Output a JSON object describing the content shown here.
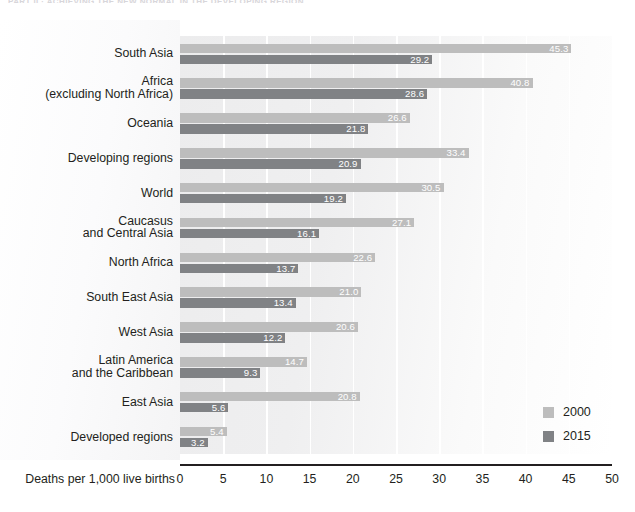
{
  "running_head": "PART II  ·  ACHIEVING THE NEW NORMAL IN THE DEVELOPING REGION",
  "axis": {
    "title": "Deaths per 1,000 live births",
    "ticks": [
      0,
      5,
      10,
      15,
      20,
      25,
      30,
      35,
      40,
      45,
      50
    ],
    "min": 0,
    "max": 50
  },
  "legend": {
    "items": [
      {
        "label": "2000",
        "color": "#bdbdbd"
      },
      {
        "label": "2015",
        "color": "#808285"
      }
    ]
  },
  "colors": {
    "series_2000": "#bdbdbd",
    "series_2015": "#808285",
    "plot_background": "#f0f0f1",
    "gridline": "#ffffff",
    "axis_line": "#231f20",
    "text": "#231f20",
    "value_label": "#ffffff"
  },
  "chart_data": {
    "type": "bar",
    "orientation": "horizontal",
    "title": "",
    "subtitle": "",
    "xlabel": "Deaths per 1,000 live births",
    "ylabel": "",
    "xlim": [
      0,
      50
    ],
    "grid": true,
    "legend_position": "bottom-right",
    "categories": [
      "South Asia",
      "Africa\n(excluding North Africa)",
      "Oceania",
      "Developing regions",
      "World",
      "Caucasus\nand Central Asia",
      "North Africa",
      "South East Asia",
      "West Asia",
      "Latin America\nand the Caribbean",
      "East Asia",
      "Developed regions"
    ],
    "series": [
      {
        "name": "2000",
        "color": "#bdbdbd",
        "values": [
          45.3,
          40.8,
          26.6,
          33.4,
          30.5,
          27.1,
          22.6,
          21.0,
          20.6,
          14.7,
          20.8,
          5.4
        ]
      },
      {
        "name": "2015",
        "color": "#808285",
        "values": [
          29.2,
          28.6,
          21.8,
          20.9,
          19.2,
          16.1,
          13.7,
          13.4,
          12.2,
          9.3,
          5.6,
          3.2
        ]
      }
    ]
  }
}
